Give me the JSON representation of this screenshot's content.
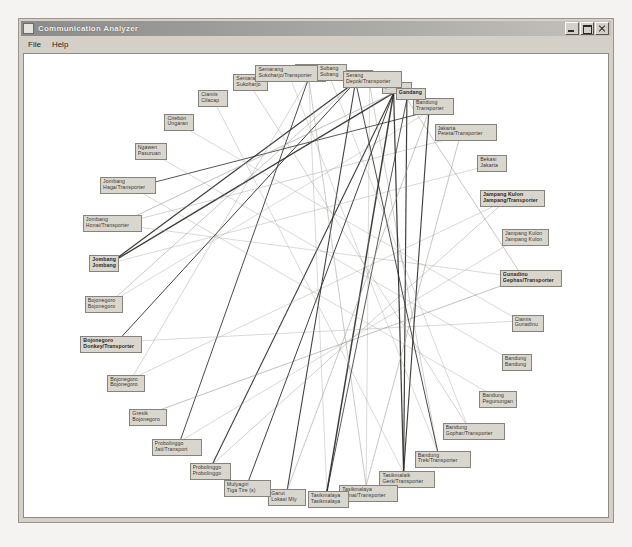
{
  "window": {
    "title": "Communication Analyzer",
    "icon": "app-icon",
    "controls": [
      {
        "name": "minimize-button",
        "glyph": "_"
      },
      {
        "name": "maximize-button",
        "glyph": "□"
      },
      {
        "name": "close-button",
        "glyph": "×"
      }
    ]
  },
  "menu": {
    "items": [
      {
        "label": "File"
      },
      {
        "label": "Help"
      }
    ]
  },
  "colors": {
    "window_face": "#d4d0c8",
    "title_bar": "#8b8b8b",
    "canvas": "#ffffff",
    "node_fill": "#d9d6ce",
    "node_border": "#86837c",
    "edge_dark": "#2e2c29",
    "edge_light": "#9a9792"
  },
  "chart_data": {
    "type": "network",
    "layout": "circular",
    "title": "",
    "center": {
      "x": 293,
      "y": 232
    },
    "radius": 208,
    "node_count": 32,
    "nodes": [
      {
        "id": 0,
        "angle": -92,
        "line1": "Jakarta",
        "line2": "Pusat",
        "bold": false
      },
      {
        "id": 1,
        "angle": -79,
        "line1": "porter",
        "line2": "",
        "bold": false
      },
      {
        "id": 2,
        "angle": -68,
        "line1": "porter",
        "line2": "",
        "bold": false
      },
      {
        "id": 3,
        "angle": -57,
        "line1": "Bandung",
        "line2": "Transporter",
        "bold": false
      },
      {
        "id": 4,
        "angle": -46,
        "line1": "Jakarta",
        "line2": "Peteta/Transporter",
        "bold": false
      },
      {
        "id": 5,
        "angle": -35,
        "line1": "Bekasi",
        "line2": "Jakarta",
        "bold": false
      },
      {
        "id": 6,
        "angle": -24,
        "line1": "Jampang Kulon",
        "line2": "Jampang/Transporter",
        "bold": true
      },
      {
        "id": 7,
        "angle": -13,
        "line1": "Jampang Kulon",
        "line2": "Jampang Kulon",
        "bold": false
      },
      {
        "id": 8,
        "angle": -2,
        "line1": "Gunadinu",
        "line2": "Gephas/Transporter",
        "bold": true
      },
      {
        "id": 9,
        "angle": 10,
        "line1": "Ciamis",
        "line2": "Gunadinu",
        "bold": false
      },
      {
        "id": 10,
        "angle": 21,
        "line1": "Bandung",
        "line2": "Bandung",
        "bold": false
      },
      {
        "id": 11,
        "angle": 32,
        "line1": "Bandung",
        "line2": "Pegunungan",
        "bold": false
      },
      {
        "id": 12,
        "angle": 43,
        "line1": "Bandung",
        "line2": "Gophar/Transporter",
        "bold": false
      },
      {
        "id": 13,
        "angle": 54,
        "line1": "Bandung",
        "line2": "Trek/Transporter",
        "bold": false
      },
      {
        "id": 14,
        "angle": 65,
        "line1": "Tasikmalaik",
        "line2": "Gerk/Transporter",
        "bold": false
      },
      {
        "id": 15,
        "angle": 76,
        "line1": "Tasikmalaya",
        "line2": "Honai/Transporter",
        "bold": false
      },
      {
        "id": 16,
        "angle": 87,
        "line1": "Tasikmalaya",
        "line2": "Tasikmalaya",
        "bold": false
      },
      {
        "id": 17,
        "angle": 98,
        "line1": "Garut",
        "line2": "Lokasi Mly",
        "bold": false
      },
      {
        "id": 18,
        "angle": 109,
        "line1": "Mulyagiri",
        "line2": "Tiga Tire (s)",
        "bold": false
      },
      {
        "id": 19,
        "angle": 120,
        "line1": "Probolinggo",
        "line2": "Probolinggo",
        "bold": false
      },
      {
        "id": 20,
        "angle": 131,
        "line1": "Probolinggo",
        "line2": "Jati/Transport",
        "bold": false
      },
      {
        "id": 21,
        "angle": 142,
        "line1": "Gresik",
        "line2": "Bojonegoro",
        "bold": false
      },
      {
        "id": 22,
        "angle": 153,
        "line1": "Bojonegoro",
        "line2": "Bojonegoro",
        "bold": false
      },
      {
        "id": 23,
        "angle": 164,
        "line1": "Bojonegoro",
        "line2": "Donkey/Transporter",
        "bold": true
      },
      {
        "id": 24,
        "angle": 175,
        "line1": "Bojonegoro",
        "line2": "Bojonegoro",
        "bold": false
      },
      {
        "id": 25,
        "angle": 186,
        "line1": "Jombang",
        "line2": "Jombang",
        "bold": true
      },
      {
        "id": 26,
        "angle": 197,
        "line1": "Jombang",
        "line2": "Honai/Transporter",
        "bold": false
      },
      {
        "id": 27,
        "angle": 208,
        "line1": "Jombang",
        "line2": "Haga/Transporter",
        "bold": false
      },
      {
        "id": 28,
        "angle": 219,
        "line1": "Ngawen",
        "line2": "Pasuruan",
        "bold": false
      },
      {
        "id": 29,
        "angle": 230,
        "line1": "Cirebon",
        "line2": "Ungaran",
        "bold": false
      },
      {
        "id": 30,
        "angle": 241,
        "line1": "Ciamis",
        "line2": "Cilacap",
        "bold": false
      },
      {
        "id": 31,
        "angle": 252,
        "line1": "Semarang",
        "line2": "Sukoharjo",
        "bold": false
      },
      {
        "id": 32,
        "angle": 263,
        "line1": "Semarang",
        "line2": "Sukoharjo/Transporter",
        "bold": false
      },
      {
        "id": 33,
        "angle": 274,
        "line1": "Subang",
        "line2": "Subang",
        "bold": false
      },
      {
        "id": 34,
        "angle": 285,
        "line1": "Serang",
        "line2": "Depok/Transporter",
        "bold": false
      },
      {
        "id": 35,
        "angle": 296,
        "line1": "Gandang",
        "line2": "",
        "bold": true
      }
    ],
    "edges": [
      {
        "from": 1,
        "to": 25,
        "weight": 2.0
      },
      {
        "from": 1,
        "to": 23,
        "weight": 1.6
      },
      {
        "from": 2,
        "to": 25,
        "weight": 2.2
      },
      {
        "from": 2,
        "to": 19,
        "weight": 1.8
      },
      {
        "from": 0,
        "to": 20,
        "weight": 1.5
      },
      {
        "from": 0,
        "to": 16,
        "weight": 0.7
      },
      {
        "from": 35,
        "to": 14,
        "weight": 1.9
      },
      {
        "from": 35,
        "to": 8,
        "weight": 1.2
      },
      {
        "from": 34,
        "to": 13,
        "weight": 1.0
      },
      {
        "from": 3,
        "to": 27,
        "weight": 1.4
      },
      {
        "from": 3,
        "to": 24,
        "weight": 0.8
      },
      {
        "from": 4,
        "to": 26,
        "weight": 0.9
      },
      {
        "from": 6,
        "to": 22,
        "weight": 0.7
      },
      {
        "from": 8,
        "to": 21,
        "weight": 1.3
      },
      {
        "from": 8,
        "to": 26,
        "weight": 0.8
      },
      {
        "from": 2,
        "to": 16,
        "weight": 2.4
      },
      {
        "from": 1,
        "to": 17,
        "weight": 1.7
      },
      {
        "from": 0,
        "to": 15,
        "weight": 1.1
      },
      {
        "from": 31,
        "to": 12,
        "weight": 0.9
      },
      {
        "from": 30,
        "to": 14,
        "weight": 0.6
      },
      {
        "from": 25,
        "to": 5,
        "weight": 0.8
      },
      {
        "from": 23,
        "to": 9,
        "weight": 0.7
      },
      {
        "from": 19,
        "to": 6,
        "weight": 1.0
      },
      {
        "from": 20,
        "to": 7,
        "weight": 0.6
      },
      {
        "from": 16,
        "to": 35,
        "weight": 1.4
      },
      {
        "from": 15,
        "to": 34,
        "weight": 0.7
      },
      {
        "from": 27,
        "to": 11,
        "weight": 0.6
      },
      {
        "from": 28,
        "to": 10,
        "weight": 0.5
      },
      {
        "from": 2,
        "to": 14,
        "weight": 2.0
      },
      {
        "from": 1,
        "to": 13,
        "weight": 1.5
      },
      {
        "from": 3,
        "to": 14,
        "weight": 1.8
      },
      {
        "from": 4,
        "to": 15,
        "weight": 1.2
      },
      {
        "from": 26,
        "to": 2,
        "weight": 1.3
      },
      {
        "from": 24,
        "to": 1,
        "weight": 1.1
      },
      {
        "from": 22,
        "to": 0,
        "weight": 0.9
      },
      {
        "from": 18,
        "to": 2,
        "weight": 1.6
      },
      {
        "from": 17,
        "to": 3,
        "weight": 1.2
      },
      {
        "from": 12,
        "to": 33,
        "weight": 0.6
      },
      {
        "from": 13,
        "to": 32,
        "weight": 0.5
      },
      {
        "from": 9,
        "to": 29,
        "weight": 0.6
      }
    ]
  }
}
